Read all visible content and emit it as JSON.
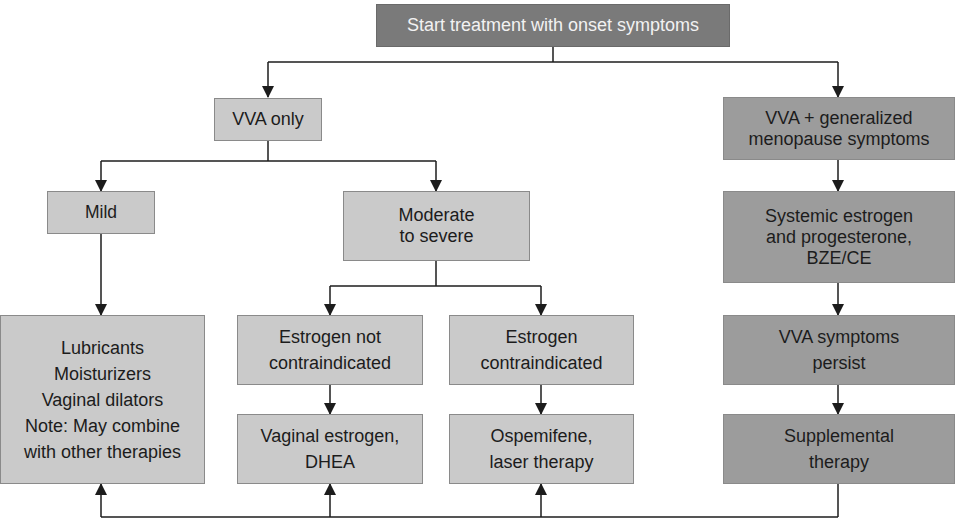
{
  "diagram": {
    "type": "flowchart",
    "title": "Start treatment with onset symptoms",
    "colors": {
      "root_fill": "#7a7a7a",
      "light_fill": "#cacaca",
      "dark_fill": "#9c9c9c",
      "line": "#1c1c1c"
    },
    "nodes": {
      "root": "Start treatment with onset symptoms",
      "vva_only": "VVA only",
      "vva_generalized": "VVA + generalized\nmenopause symptoms",
      "mild": "Mild",
      "moderate_severe": "Moderate\nto severe",
      "mild_therapy": "Lubricants\nMoisturizers\nVaginal dilators\nNote: May combine\nwith other therapies",
      "estrogen_not_contra": "Estrogen not\ncontraindicated",
      "estrogen_contra": "Estrogen\ncontraindicated",
      "vaginal_estrogen": "Vaginal estrogen,\nDHEA",
      "ospemifene": "Ospemifene,\nlaser therapy",
      "systemic": "Systemic estrogen\nand progesterone,\nBZE/CE",
      "persist": "VVA symptoms\npersist",
      "supplemental": "Supplemental\ntherapy"
    },
    "edges": [
      [
        "root",
        "vva_only"
      ],
      [
        "root",
        "vva_generalized"
      ],
      [
        "vva_only",
        "mild"
      ],
      [
        "vva_only",
        "moderate_severe"
      ],
      [
        "mild",
        "mild_therapy"
      ],
      [
        "moderate_severe",
        "estrogen_not_contra"
      ],
      [
        "moderate_severe",
        "estrogen_contra"
      ],
      [
        "estrogen_not_contra",
        "vaginal_estrogen"
      ],
      [
        "estrogen_contra",
        "ospemifene"
      ],
      [
        "vva_generalized",
        "systemic"
      ],
      [
        "systemic",
        "persist"
      ],
      [
        "persist",
        "supplemental"
      ],
      [
        "supplemental",
        "mild_therapy"
      ],
      [
        "supplemental",
        "vaginal_estrogen"
      ],
      [
        "supplemental",
        "ospemifene"
      ]
    ]
  }
}
